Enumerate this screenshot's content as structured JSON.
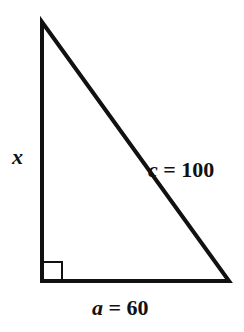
{
  "diagram": {
    "type": "right-triangle",
    "colors": {
      "stroke": "#111111",
      "background": "#ffffff"
    },
    "vertices": {
      "top": [
        42,
        20
      ],
      "right_angle": [
        42,
        281
      ],
      "bottom_right": [
        230,
        281
      ]
    },
    "right_angle_marker": true,
    "labels": {
      "vertical_side": {
        "variable": "x",
        "text": "x"
      },
      "hypotenuse": {
        "variable": "c",
        "equals": "=",
        "value": "100",
        "text": "c = 100"
      },
      "base": {
        "variable": "a",
        "equals": "=",
        "value": "60",
        "text": "a = 60"
      }
    }
  }
}
